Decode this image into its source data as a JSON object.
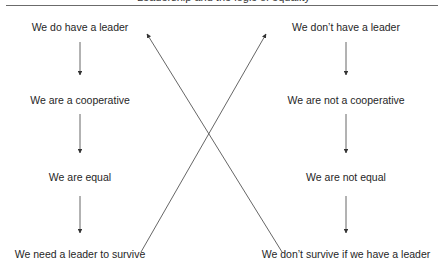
{
  "figure": {
    "heading_fragment": "Leadership and the logic of equality",
    "left_chain": {
      "nodes": [
        {
          "label": "We do have a leader"
        },
        {
          "label": "We are a cooperative"
        },
        {
          "label": "We are equal"
        },
        {
          "label": "We need a leader to survive"
        }
      ]
    },
    "right_chain": {
      "nodes": [
        {
          "label": "We don’t have a leader"
        },
        {
          "label": "We are not a cooperative"
        },
        {
          "label": "We are not equal"
        },
        {
          "label": "We don’t survive if we have a leader"
        }
      ]
    },
    "cross_links": [
      {
        "from": "We need a leader to survive",
        "to": "We don’t have a leader"
      },
      {
        "from": "We don’t survive if we have a leader",
        "to": "We do have a leader"
      }
    ],
    "colors": {
      "line": "#555555",
      "text": "#262626"
    }
  }
}
